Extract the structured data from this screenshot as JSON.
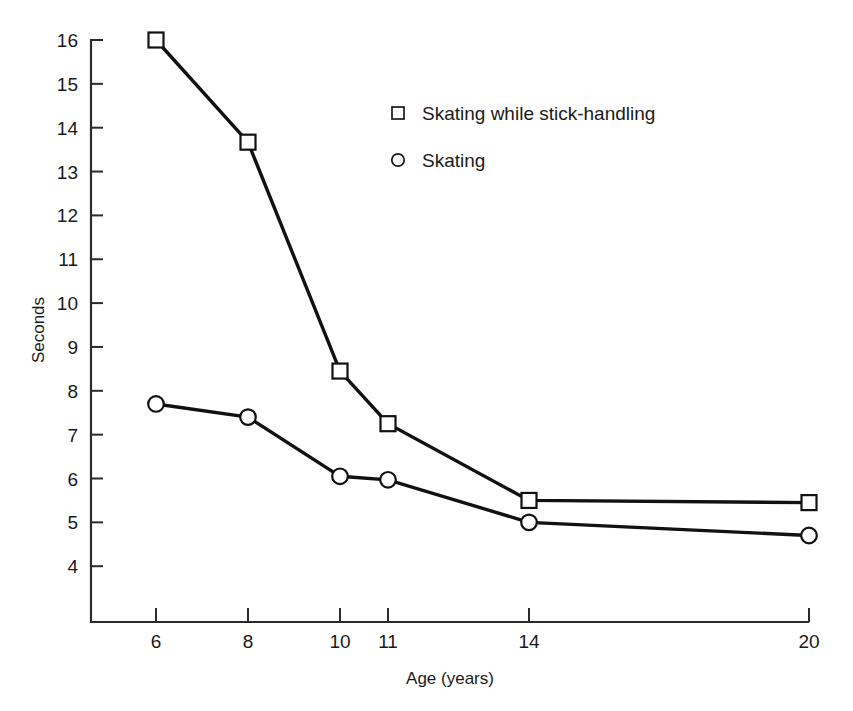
{
  "chart_data": {
    "type": "line",
    "title": "",
    "xlabel": "Age (years)",
    "ylabel": "Seconds",
    "categories": [
      "6",
      "8",
      "10",
      "11",
      "14",
      "20"
    ],
    "x_tick_labels": [
      "6",
      "8",
      "10",
      "11",
      "14",
      "20"
    ],
    "y_tick_labels": [
      "4",
      "5",
      "6",
      "7",
      "8",
      "9",
      "10",
      "11",
      "12",
      "13",
      "14",
      "15",
      "16"
    ],
    "ylim": [
      3.6,
      16.3
    ],
    "grid": false,
    "legend_position": "upper-center",
    "x_axis_scale": "categorical-nonuniform",
    "series": [
      {
        "name": "Skating while stick-handling",
        "marker": "square-open",
        "values": [
          16.0,
          13.67,
          8.45,
          7.25,
          5.5,
          5.45
        ]
      },
      {
        "name": "Skating",
        "marker": "circle-open",
        "values": [
          7.7,
          7.4,
          6.05,
          5.97,
          5.0,
          4.7
        ]
      }
    ]
  },
  "legend": {
    "entries": [
      {
        "label": "Skating while stick-handling",
        "marker": "square-open"
      },
      {
        "label": "Skating",
        "marker": "circle-open"
      }
    ]
  },
  "axes": {
    "y_title": "Seconds",
    "x_title": "Age (years)"
  }
}
